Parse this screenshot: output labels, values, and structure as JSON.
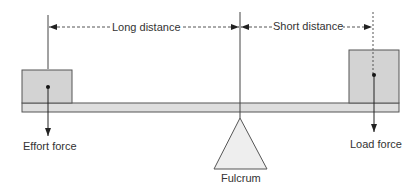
{
  "diagram": {
    "labels": {
      "long_distance": "Long distance",
      "short_distance": "Short distance",
      "effort_force": "Effort force",
      "load_force": "Load force",
      "fulcrum": "Fulcrum"
    },
    "colors": {
      "line": "#333333",
      "box_fill": "#d3d3d3",
      "beam_fill": "#dedede",
      "triangle_fill": "#eeeeee",
      "text": "#333333"
    }
  }
}
